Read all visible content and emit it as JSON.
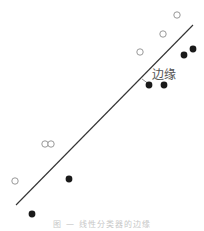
{
  "diagram": {
    "label": "边缘",
    "caption": "图 — 线性分类器的边缘",
    "line": {
      "x1": 16,
      "y1": 205,
      "x2": 193,
      "y2": 25,
      "color": "#333333"
    },
    "label_pos": {
      "x": 152,
      "y": 65
    },
    "label_tick": {
      "x1": 142,
      "y1": 79,
      "x2": 149,
      "y2": 84
    },
    "open_points": [
      {
        "x": 177,
        "y": 15
      },
      {
        "x": 163,
        "y": 34
      },
      {
        "x": 140,
        "y": 52
      },
      {
        "x": 45,
        "y": 144
      },
      {
        "x": 51,
        "y": 144
      },
      {
        "x": 15,
        "y": 181
      }
    ],
    "filled_points": [
      {
        "x": 193,
        "y": 49
      },
      {
        "x": 184,
        "y": 55
      },
      {
        "x": 149,
        "y": 85
      },
      {
        "x": 164,
        "y": 85
      },
      {
        "x": 69,
        "y": 179
      },
      {
        "x": 32,
        "y": 214
      }
    ],
    "colors": {
      "open_stroke": "#999999",
      "filled": "#1a1a1a"
    }
  }
}
